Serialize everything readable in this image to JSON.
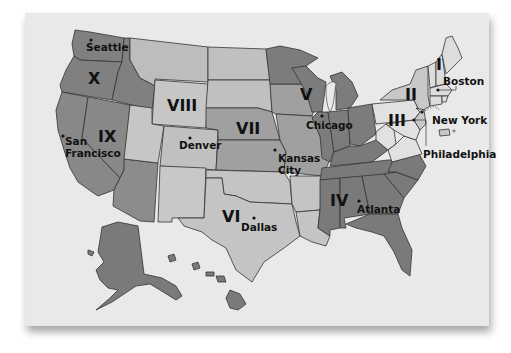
{
  "map": {
    "title": "",
    "colors": {
      "background": "#e9e9e9",
      "dark": "#7f7f7f",
      "medium": "#a3a3a3",
      "light": "#c4c4c4",
      "pale": "#d8d8d8",
      "border": "#333333",
      "text": "#111111"
    },
    "regions": [
      {
        "id": "I",
        "label": "I",
        "shade": "pale"
      },
      {
        "id": "II",
        "label": "II",
        "shade": "light"
      },
      {
        "id": "III",
        "label": "III",
        "shade": "pale"
      },
      {
        "id": "IV",
        "label": "IV",
        "shade": "dark"
      },
      {
        "id": "V",
        "label": "V",
        "shade": "dark"
      },
      {
        "id": "VI",
        "label": "VI",
        "shade": "light"
      },
      {
        "id": "VII",
        "label": "VII",
        "shade": "medium"
      },
      {
        "id": "VIII",
        "label": "VIII",
        "shade": "light"
      },
      {
        "id": "IX",
        "label": "IX",
        "shade": "dark"
      },
      {
        "id": "X",
        "label": "X",
        "shade": "dark"
      }
    ],
    "cities": [
      {
        "name": "Seattle"
      },
      {
        "name": "San Francisco",
        "line1": "San",
        "line2": "Francisco"
      },
      {
        "name": "Denver"
      },
      {
        "name": "Kansas City",
        "line1": "Kansas",
        "line2": "City"
      },
      {
        "name": "Chicago"
      },
      {
        "name": "Dallas"
      },
      {
        "name": "Atlanta"
      },
      {
        "name": "Boston"
      },
      {
        "name": "New York"
      },
      {
        "name": "Philadelphia"
      }
    ]
  }
}
